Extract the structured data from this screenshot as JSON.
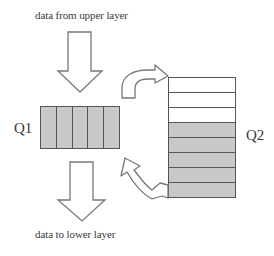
{
  "diagram": {
    "top_caption": "data from upper layer",
    "bottom_caption": "data to lower layer",
    "q1": {
      "label": "Q1",
      "cells": [
        {
          "state": "filled"
        },
        {
          "state": "filled"
        },
        {
          "state": "filled"
        },
        {
          "state": "filled"
        },
        {
          "state": "filled"
        }
      ]
    },
    "q2": {
      "label": "Q2",
      "rows": [
        {
          "state": "empty"
        },
        {
          "state": "empty"
        },
        {
          "state": "empty"
        },
        {
          "state": "filled"
        },
        {
          "state": "filled"
        },
        {
          "state": "filled"
        },
        {
          "state": "filled"
        },
        {
          "state": "filled"
        }
      ]
    },
    "arrows": [
      {
        "name": "down-arrow-in",
        "direction": "down",
        "from": "upper layer",
        "to": "Q1"
      },
      {
        "name": "down-arrow-out",
        "direction": "down",
        "from": "Q1",
        "to": "lower layer"
      },
      {
        "name": "curved-arrow-q1-to-q2",
        "direction": "curve-right",
        "from": "Q1",
        "to": "Q2 top"
      },
      {
        "name": "curved-arrow-q2-to-q1",
        "direction": "curve-up-left",
        "from": "Q2 bottom",
        "to": "Q1"
      }
    ],
    "colors": {
      "fill": "#c8c8c8",
      "stroke": "#555555",
      "arrow_stroke": "#777777",
      "text": "#3a3a3a"
    }
  }
}
